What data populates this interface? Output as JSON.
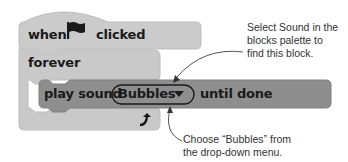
{
  "blocks": {
    "hat": {
      "when": "when",
      "clicked": "clicked",
      "icon": "green-flag-icon"
    },
    "forever": {
      "label": "forever",
      "loop_icon": "loop-arrow-icon"
    },
    "play_sound": {
      "prefix": "play sound",
      "dropdown_value": "Bubbles",
      "suffix": "until done"
    }
  },
  "annotations": {
    "top": [
      "Select Sound in the",
      "blocks palette to",
      "find this block."
    ],
    "bottom": [
      "Choose “Bubbles” from",
      "the drop-down menu."
    ]
  },
  "colors": {
    "control_block": "#c9c9c9",
    "sound_block": "#8e8e8e",
    "text": "#1a1a1a",
    "annotation_line": "#555555"
  }
}
